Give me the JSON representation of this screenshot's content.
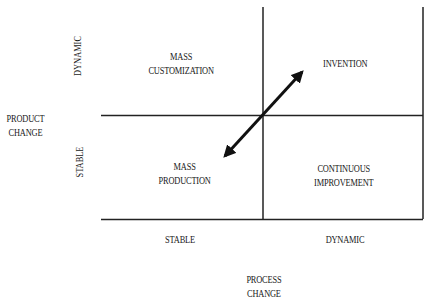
{
  "diagram": {
    "y_axis": {
      "title_line1": "PRODUCT",
      "title_line2": "CHANGE",
      "top_label": "DYNAMIC",
      "bottom_label": "STABLE"
    },
    "x_axis": {
      "title_line1": "PROCESS",
      "title_line2": "CHANGE",
      "left_label": "STABLE",
      "right_label": "DYNAMIC"
    },
    "quadrants": {
      "top_left": {
        "line1": "MASS",
        "line2": "CUSTOMIZATION"
      },
      "top_right": {
        "line1": "INVENTION"
      },
      "bottom_left": {
        "line1": "MASS",
        "line2": "PRODUCTION"
      },
      "bottom_right": {
        "line1": "CONTINUOUS",
        "line2": "IMPROVEMENT"
      }
    },
    "arrow": {
      "type": "double-headed",
      "from": "MASS PRODUCTION",
      "to": "INVENTION"
    },
    "line_color": "#222222"
  }
}
